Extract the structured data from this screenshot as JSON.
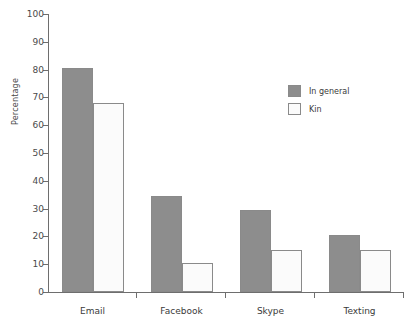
{
  "chart_data": {
    "type": "bar",
    "title": "",
    "xlabel": "",
    "ylabel": "Percentage",
    "ylim": [
      0,
      100
    ],
    "ytick_step": 10,
    "yticks": [
      0,
      10,
      20,
      30,
      40,
      50,
      60,
      70,
      80,
      90,
      100
    ],
    "grid": false,
    "legend_position": "upper right",
    "categories": [
      "Email",
      "Facebook",
      "Skype",
      "Texting"
    ],
    "series": [
      {
        "name": "In general",
        "color": "#8d8d8d",
        "values": [
          80.5,
          34.5,
          29.5,
          20.5
        ]
      },
      {
        "name": "Kin",
        "color": "#fbfbfb",
        "values": [
          68.0,
          10.5,
          15.2,
          15.2
        ]
      }
    ]
  },
  "legend": {
    "entries": [
      {
        "label": "In general",
        "swatch": "general"
      },
      {
        "label": "Kin",
        "swatch": "kin"
      }
    ]
  },
  "colors": {
    "in_general": "#8d8d8d",
    "kin": "#fbfbfb",
    "axis": "#6e6e6e",
    "text": "#3a3a3a",
    "background": "#ffffff"
  }
}
